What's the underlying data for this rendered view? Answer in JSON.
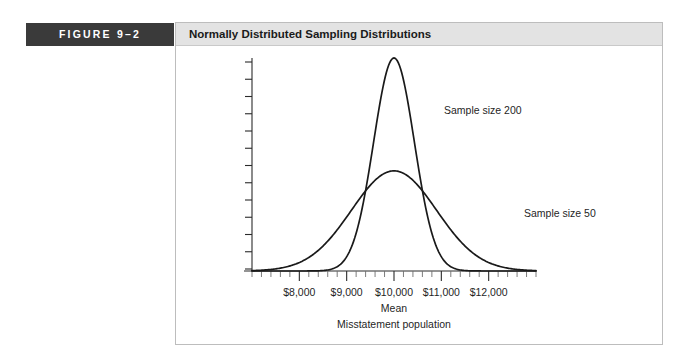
{
  "figure": {
    "number_label": "FIGURE 9–2",
    "title": "Normally Distributed Sampling Distributions"
  },
  "colors": {
    "tab_background": "#3a3a3a",
    "tab_text": "#ffffff",
    "title_bar_background": "#e3e3e3",
    "panel_border": "#bdbdbd",
    "curve_stroke": "#1a1a1a",
    "axis_stroke": "#2b2b2b"
  },
  "chart_data": {
    "type": "line",
    "title": "Normally Distributed Sampling Distributions",
    "xlabel": "Mean",
    "xlabel_sub": "Misstatement population",
    "ylabel": "",
    "xlim": [
      7000,
      13000
    ],
    "x_tick_labels": [
      "$8,000",
      "$9,000",
      "$10,000",
      "$11,000",
      "$12,000"
    ],
    "x_tick_values": [
      8000,
      9000,
      10000,
      11000,
      12000
    ],
    "x_minor_tick_count_per_interval": 4,
    "y_tick_count": 13,
    "y_tick_labels": [],
    "grid": false,
    "legend": "inline-annotations",
    "annotations": [
      {
        "text": "Sample size 200",
        "x": 10550,
        "y_rel": 0.88
      },
      {
        "text": "Sample size 50",
        "x": 11650,
        "y_rel": 0.36
      }
    ],
    "series": [
      {
        "name": "Sample size 200",
        "distribution": "normal",
        "mean": 10000,
        "std_dev": 430,
        "peak_height_rel": 1.0,
        "label": "Sample size 200"
      },
      {
        "name": "Sample size 50",
        "distribution": "normal",
        "mean": 10000,
        "std_dev": 900,
        "peak_height_rel": 0.47,
        "label": "Sample size 50"
      }
    ]
  }
}
